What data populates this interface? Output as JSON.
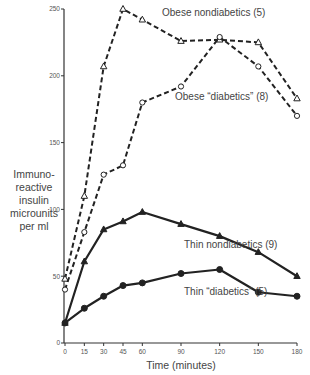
{
  "chart_data": {
    "type": "line",
    "title": "",
    "xlabel": "Time (minutes)",
    "ylabel": "Immuno-reactive insulin microunits per ml",
    "ylabel_lines": [
      "Immuno-",
      "reactive",
      "insulin",
      "microunits",
      "per ml"
    ],
    "x": [
      0,
      15,
      30,
      45,
      60,
      90,
      120,
      150,
      180
    ],
    "xticks": [
      0,
      15,
      30,
      45,
      60,
      90,
      120,
      150,
      180
    ],
    "yticks": [
      0,
      50,
      100,
      150,
      200,
      250
    ],
    "xlim": [
      0,
      180
    ],
    "ylim": [
      0,
      250
    ],
    "grid": false,
    "legend": "inline labels",
    "series": [
      {
        "name": "Obese nondiabetics (5)",
        "marker": "open-triangle",
        "line": "dashed",
        "values": [
          48,
          110,
          207,
          250,
          242,
          226,
          227,
          225,
          183
        ]
      },
      {
        "name": "Obese “diabetics” (8)",
        "marker": "open-circle",
        "line": "dashed",
        "values": [
          40,
          83,
          126,
          133,
          180,
          192,
          229,
          207,
          170
        ]
      },
      {
        "name": "Thin nondiabetics (9)",
        "marker": "filled-triangle",
        "line": "solid",
        "values": [
          15,
          61,
          85,
          91,
          98,
          89,
          80,
          68,
          50
        ]
      },
      {
        "name": "Thin “diabetics” (5)",
        "marker": "filled-circle",
        "line": "solid",
        "values": [
          15,
          26,
          35,
          43,
          45,
          52,
          55,
          38,
          35
        ]
      }
    ],
    "annotations": [
      {
        "text": "Obese nondiabetics (5)",
        "series": 0
      },
      {
        "text": "Obese “diabetics” (8)",
        "series": 1
      },
      {
        "text": "Thin nondiabetics (9)",
        "series": 2
      },
      {
        "text": "Thin “diabetics” (5)",
        "series": 3
      }
    ]
  },
  "colors": {
    "line": "#222222",
    "text": "#444444",
    "axis": "#333333"
  }
}
